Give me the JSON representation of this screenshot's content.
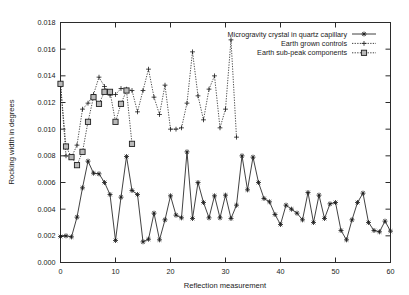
{
  "chart_data": {
    "type": "line",
    "title": "",
    "xlabel": "Reflection measurement",
    "ylabel": "Rocking width in degrees",
    "xlim": [
      0,
      60
    ],
    "ylim": [
      0,
      0.018
    ],
    "xticks": [
      "0",
      "10",
      "20",
      "30",
      "40",
      "50",
      "60"
    ],
    "xtick_values": [
      0,
      10,
      20,
      30,
      40,
      50,
      60
    ],
    "yticks": [
      "0.000",
      "0.002",
      "0.004",
      "0.006",
      "0.008",
      "0.010",
      "0.012",
      "0.014",
      "0.016",
      "0.018"
    ],
    "ytick_values": [
      0.0,
      0.002,
      0.004,
      0.006,
      0.008,
      0.01,
      0.012,
      0.014,
      0.016,
      0.018
    ],
    "grid": false,
    "legend_position": "top-right",
    "series": [
      {
        "name": "Microgravity crystal in quartz capillary",
        "marker": "star",
        "linestyle": "solid",
        "color": "#202020",
        "x": [
          0,
          1,
          2,
          3,
          4,
          5,
          6,
          7,
          8,
          9,
          10,
          11,
          12,
          13,
          14,
          15,
          16,
          17,
          18,
          19,
          20,
          21,
          22,
          23,
          24,
          25,
          26,
          27,
          28,
          29,
          30,
          31,
          32,
          33,
          34,
          35,
          36,
          37,
          38,
          39,
          40,
          41,
          42,
          43,
          44,
          45,
          46,
          47,
          48,
          49,
          50,
          51,
          52,
          53,
          54,
          55,
          56,
          57,
          58,
          59,
          60
        ],
        "y": [
          0.00195,
          0.002,
          0.00192,
          0.0034,
          0.0056,
          0.0076,
          0.0067,
          0.00665,
          0.006,
          0.0051,
          0.00165,
          0.0049,
          0.00795,
          0.0054,
          0.0051,
          0.00155,
          0.00175,
          0.0037,
          0.0017,
          0.0032,
          0.005,
          0.00355,
          0.00335,
          0.0083,
          0.0033,
          0.006,
          0.0045,
          0.00335,
          0.005,
          0.00335,
          0.00505,
          0.0033,
          0.0043,
          0.008,
          0.00545,
          0.0079,
          0.006,
          0.0048,
          0.00455,
          0.0036,
          0.00285,
          0.0043,
          0.004,
          0.0037,
          0.0032,
          0.00525,
          0.003,
          0.00505,
          0.0033,
          0.0044,
          0.0045,
          0.0024,
          0.0017,
          0.0032,
          0.0045,
          0.0052,
          0.003,
          0.0024,
          0.0023,
          0.0031,
          0.00235
        ]
      },
      {
        "name": "Earth grown controls",
        "marker": "plus",
        "linestyle": "dotted",
        "color": "#303030",
        "x": [
          0,
          1,
          2,
          3,
          4,
          5,
          6,
          7,
          8,
          9,
          10,
          11,
          12,
          13,
          14,
          15,
          16,
          17,
          18,
          19,
          20,
          21,
          22,
          23,
          24,
          25,
          26,
          27,
          28,
          29,
          30,
          31,
          32
        ],
        "y": [
          0.0134,
          0.008,
          0.0079,
          0.0088,
          0.0115,
          0.01195,
          0.0126,
          0.0139,
          0.0132,
          0.01255,
          0.0126,
          0.01305,
          0.013,
          0.0129,
          0.0113,
          0.0129,
          0.0145,
          0.0124,
          0.0111,
          0.0133,
          0.01,
          0.01,
          0.0101,
          0.01195,
          0.0158,
          0.0125,
          0.0107,
          0.013,
          0.014,
          0.0101,
          0.0115,
          0.0167,
          0.0094
        ]
      },
      {
        "name": "Earth sub-peak components",
        "marker": "square",
        "linestyle": "dotted",
        "color": "#1f1f1f",
        "x": [
          0,
          1,
          2,
          3,
          4,
          5,
          6,
          7,
          8,
          9,
          10,
          11,
          12,
          13
        ],
        "y": [
          0.0134,
          0.0087,
          0.0079,
          0.0073,
          0.0083,
          0.01055,
          0.0124,
          0.0119,
          0.0128,
          0.0128,
          0.01055,
          0.0119,
          0.0129,
          0.0089
        ]
      }
    ]
  },
  "legend": {
    "entries": [
      {
        "label": "Microgravity crystal in quartz capillary",
        "marker": "star",
        "linestyle": "solid"
      },
      {
        "label": "Earth grown controls",
        "marker": "plus",
        "linestyle": "dotted"
      },
      {
        "label": "Earth sub-peak components",
        "marker": "square",
        "linestyle": "dotted"
      }
    ]
  }
}
